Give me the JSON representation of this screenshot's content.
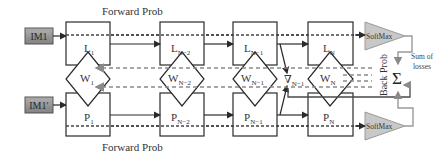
{
  "diagram": {
    "inputs": {
      "top": {
        "label": "IM1"
      },
      "bottom": {
        "label": "IM1′"
      }
    },
    "forward_labels": {
      "top": "Forward Prob",
      "bottom": "Forward Prob"
    },
    "columns": [
      {
        "top_base": "L",
        "top_sub": "1",
        "weight_base": "W",
        "weight_sub": "1",
        "bottom_base": "P",
        "bottom_sub": "1"
      },
      {
        "top_base": "L",
        "top_sub": "N−2",
        "weight_base": "W",
        "weight_sub": "N−2",
        "bottom_base": "P",
        "bottom_sub": "N−2"
      },
      {
        "top_base": "L",
        "top_sub": "N−1",
        "weight_base": "W",
        "weight_sub": "N−1",
        "bottom_base": "P",
        "bottom_sub": "N−1"
      },
      {
        "top_base": "L",
        "top_sub": "N",
        "weight_base": "W",
        "weight_sub": "N",
        "bottom_base": "P",
        "bottom_sub": "N"
      }
    ],
    "gradient": {
      "base": "∇",
      "sub": "N−1"
    },
    "softmax": {
      "top": "SoftMax",
      "bottom": "SoftMax"
    },
    "sum": {
      "symbol": "Σ",
      "label_line1": "Sum of",
      "label_line2": "losses"
    },
    "back_prob_label": "Back Prob",
    "colors": {
      "input_fill": "#8c8c8c",
      "softmax_fill": "#c8c8c8",
      "stroke": "#2a2a2a",
      "backprop": "#8a8a8a"
    }
  }
}
